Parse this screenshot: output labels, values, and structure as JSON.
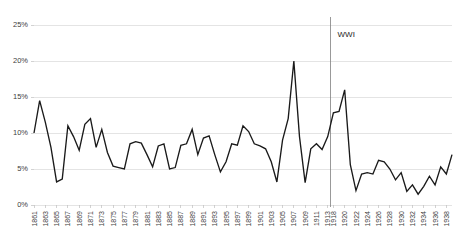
{
  "chart_data": {
    "type": "line",
    "title": "",
    "subtitle": "",
    "xlabel": "",
    "ylabel": "",
    "grid": "horizontal",
    "legend": "none",
    "ylim": [
      0,
      25
    ],
    "ytick_labels": [
      "0%",
      "5%",
      "10%",
      "15%",
      "20%",
      "25%"
    ],
    "ytick_values": [
      0,
      5,
      10,
      15,
      20,
      25
    ],
    "xtick_labels": [
      "1861",
      "1863",
      "1865",
      "1867",
      "1869",
      "1871",
      "1873",
      "1875",
      "1877",
      "1879",
      "1881",
      "1883",
      "1885",
      "1887",
      "1889",
      "1891",
      "1893",
      "1895",
      "1897",
      "1899",
      "1901",
      "1903",
      "1905",
      "1907",
      "1909",
      "1911",
      "1913",
      "1918",
      "1920",
      "1922",
      "1924",
      "1926",
      "1928",
      "1930",
      "1932",
      "1934",
      "1936",
      "1938"
    ],
    "x": [
      1861,
      1862,
      1863,
      1864,
      1865,
      1866,
      1867,
      1868,
      1869,
      1870,
      1871,
      1872,
      1873,
      1874,
      1875,
      1876,
      1877,
      1878,
      1879,
      1880,
      1881,
      1882,
      1883,
      1884,
      1885,
      1886,
      1887,
      1888,
      1889,
      1890,
      1891,
      1892,
      1893,
      1894,
      1895,
      1896,
      1897,
      1898,
      1899,
      1900,
      1901,
      1902,
      1903,
      1904,
      1905,
      1906,
      1907,
      1908,
      1909,
      1910,
      1911,
      1912,
      1913,
      1918,
      1919,
      1920,
      1921,
      1922,
      1923,
      1924,
      1925,
      1926,
      1927,
      1928,
      1929,
      1930,
      1931,
      1932,
      1933,
      1934,
      1935,
      1936,
      1937,
      1938,
      1939
    ],
    "values": [
      10.0,
      14.5,
      11.5,
      8.0,
      3.2,
      3.6,
      11.0,
      9.5,
      7.6,
      11.2,
      12.0,
      8.0,
      10.5,
      7.3,
      5.4,
      5.2,
      5.0,
      8.5,
      8.8,
      8.6,
      7.0,
      5.3,
      8.2,
      8.5,
      5.0,
      5.2,
      8.3,
      8.5,
      10.5,
      7.0,
      9.3,
      9.6,
      7.0,
      4.6,
      6.0,
      8.5,
      8.3,
      11.0,
      10.2,
      8.5,
      8.2,
      7.8,
      6.0,
      3.2,
      9.0,
      12.0,
      20.0,
      9.5,
      3.1,
      7.8,
      8.5,
      7.7,
      9.5,
      12.8,
      13.0,
      16.0,
      5.6,
      2.0,
      4.3,
      4.5,
      4.3,
      6.2,
      6.0,
      5.0,
      3.5,
      4.5,
      1.9,
      2.8,
      1.5,
      2.6,
      4.0,
      2.8,
      5.3,
      4.3,
      7.0
    ],
    "annotations": [
      {
        "label": "WWI",
        "type": "vertical-marker",
        "x": 1915.5
      }
    ],
    "series_color": "#1a1a1a",
    "gridline_color": "#d9d9d9",
    "marker_color": "#808080",
    "background": "#ffffff"
  },
  "layout": {
    "plot_left": 34,
    "plot_right": 452,
    "plot_top": 25,
    "plot_bottom": 205
  }
}
